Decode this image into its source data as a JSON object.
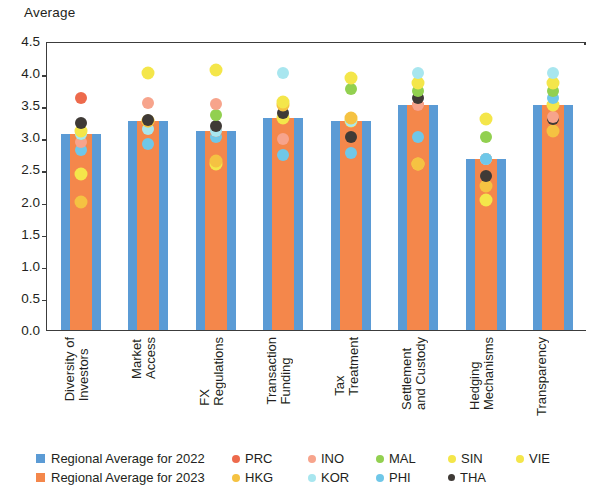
{
  "axis_title": "Average",
  "chart_data": {
    "type": "bar",
    "title": "Average",
    "xlabel": "",
    "ylabel": "Average",
    "ylim": [
      0.0,
      4.5
    ],
    "ytick_labels": [
      "4.5",
      "4.0",
      "3.5",
      "3.0",
      "2.5",
      "2.0",
      "1.5",
      "1.0",
      "0.5",
      "0.0"
    ],
    "ytick_values": [
      4.5,
      4.0,
      3.5,
      3.0,
      2.5,
      2.0,
      1.5,
      1.0,
      0.5,
      0.0
    ],
    "grid": false,
    "legend_position": "bottom",
    "categories": [
      "Diversity of\nInvestors",
      "Market\nAccess",
      "FX\nRegulations",
      "Transaction\nFunding",
      "Tax\nTreatment",
      "Settlement\nand Custody",
      "Hedging\nMechanisms",
      "Transparency"
    ],
    "series": [
      {
        "name": "Regional Average for 2022",
        "type": "bar",
        "color": "#5b9bd5",
        "values": [
          3.05,
          3.25,
          3.1,
          3.3,
          3.25,
          3.5,
          2.67,
          3.5
        ]
      },
      {
        "name": "Regional Average for 2023",
        "type": "bar",
        "color": "#f4874b",
        "values": [
          3.05,
          3.25,
          3.1,
          3.3,
          3.25,
          3.5,
          2.67,
          3.5
        ]
      }
    ],
    "scatter_series": [
      {
        "name": "PRC",
        "color": "#ed6a4c",
        "values": [
          3.62,
          3.25,
          3.1,
          3.3,
          3.25,
          3.5,
          2.67,
          3.5
        ]
      },
      {
        "name": "INO",
        "color": "#f7a48c",
        "values": [
          2.92,
          3.53,
          3.52,
          2.98,
          3.25,
          3.5,
          2.67,
          3.32
        ]
      },
      {
        "name": "MAL",
        "color": "#92d050",
        "values": [
          3.05,
          3.25,
          3.35,
          3.3,
          3.75,
          3.72,
          3.0,
          3.72
        ]
      },
      {
        "name": "SIN",
        "color": "#f4e64a",
        "values": [
          3.1,
          4.0,
          4.05,
          3.55,
          3.92,
          3.85,
          3.28,
          3.85
        ]
      },
      {
        "name": "VIE",
        "color": "#f4e64a",
        "values": [
          2.43,
          3.25,
          2.58,
          3.3,
          3.25,
          2.58,
          2.02,
          3.5
        ]
      },
      {
        "name": "HKG",
        "color": "#f5c242",
        "values": [
          2.0,
          3.25,
          2.63,
          3.5,
          3.3,
          2.58,
          2.25,
          3.1
        ]
      },
      {
        "name": "KOR",
        "color": "#a8e6ef",
        "values": [
          3.05,
          3.13,
          3.1,
          4.0,
          3.25,
          4.0,
          2.67,
          4.0
        ]
      },
      {
        "name": "PHI",
        "color": "#6fc7e8",
        "values": [
          2.8,
          2.9,
          3.0,
          2.72,
          2.75,
          3.0,
          2.67,
          3.62
        ]
      },
      {
        "name": "THA",
        "color": "#3f3a36",
        "values": [
          3.22,
          3.27,
          3.17,
          3.38,
          3.0,
          3.62,
          2.4,
          3.28
        ]
      }
    ]
  },
  "legend": {
    "bars": [
      {
        "label": "Regional Average for 2022",
        "color": "#5b9bd5"
      },
      {
        "label": "Regional Average for 2023",
        "color": "#f4874b"
      }
    ],
    "dots_row1": [
      {
        "label": "PRC",
        "color": "#ed6a4c"
      },
      {
        "label": "INO",
        "color": "#f7a48c"
      },
      {
        "label": "MAL",
        "color": "#92d050"
      },
      {
        "label": "SIN",
        "color": "#f4e64a"
      },
      {
        "label": "VIE",
        "color": "#f4e64a"
      }
    ],
    "dots_row2": [
      {
        "label": "HKG",
        "color": "#f5c242"
      },
      {
        "label": "KOR",
        "color": "#a8e6ef"
      },
      {
        "label": "PHI",
        "color": "#6fc7e8"
      },
      {
        "label": "THA",
        "color": "#3f3a36"
      }
    ]
  }
}
